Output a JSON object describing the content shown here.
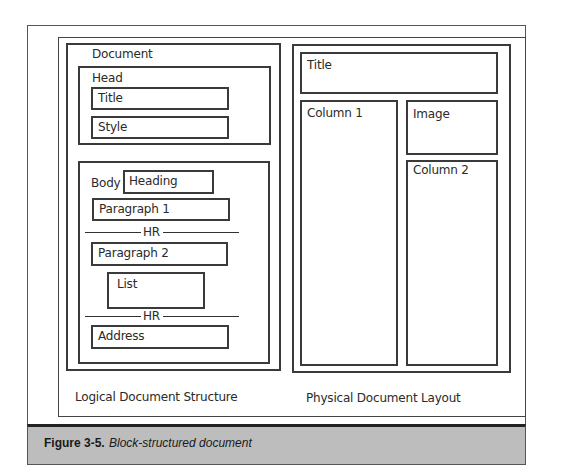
{
  "logical": {
    "document_label": "Document",
    "head_label": "Head",
    "head_items": [
      "Title",
      "Style"
    ],
    "body_label": "Body",
    "heading": "Heading",
    "paragraph1": "Paragraph 1",
    "hr1": "HR",
    "paragraph2": "Paragraph 2",
    "list": "List",
    "hr2": "HR",
    "address": "Address",
    "caption": "Logical Document Structure"
  },
  "physical": {
    "title": "Title",
    "column1": "Column 1",
    "image": "Image",
    "column2": "Column 2",
    "caption": "Physical Document Layout"
  },
  "figure": {
    "number": "Figure 3-5.",
    "title": "Block-structured document",
    "caption_bg": "#bdbdbd"
  }
}
